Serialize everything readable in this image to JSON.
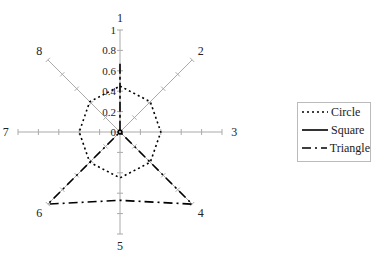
{
  "chart_data": {
    "type": "radar",
    "title": "",
    "categories": [
      "1",
      "2",
      "3",
      "4",
      "5",
      "6",
      "7",
      "8"
    ],
    "radial_ticks": [
      "0",
      "0.2",
      "0.4",
      "0.6",
      "0.8",
      "1"
    ],
    "rlim": [
      0,
      1
    ],
    "series": [
      {
        "name": "Circle",
        "style": "dotted",
        "values": [
          0.45,
          0.42,
          0.4,
          0.42,
          0.45,
          0.42,
          0.4,
          0.42
        ]
      },
      {
        "name": "Square",
        "style": "solid",
        "values": [
          0.02,
          0.02,
          0.02,
          0.02,
          0.02,
          0.02,
          0.02,
          0.02
        ]
      },
      {
        "name": "Triangle",
        "style": "dash-dot",
        "values": [
          0.67,
          0.0,
          0.0,
          1.0,
          0.67,
          1.0,
          0.0,
          0.0
        ]
      }
    ],
    "legend_position": "right"
  },
  "legend": {
    "items": [
      "Circle",
      "Square",
      "Triangle"
    ]
  }
}
